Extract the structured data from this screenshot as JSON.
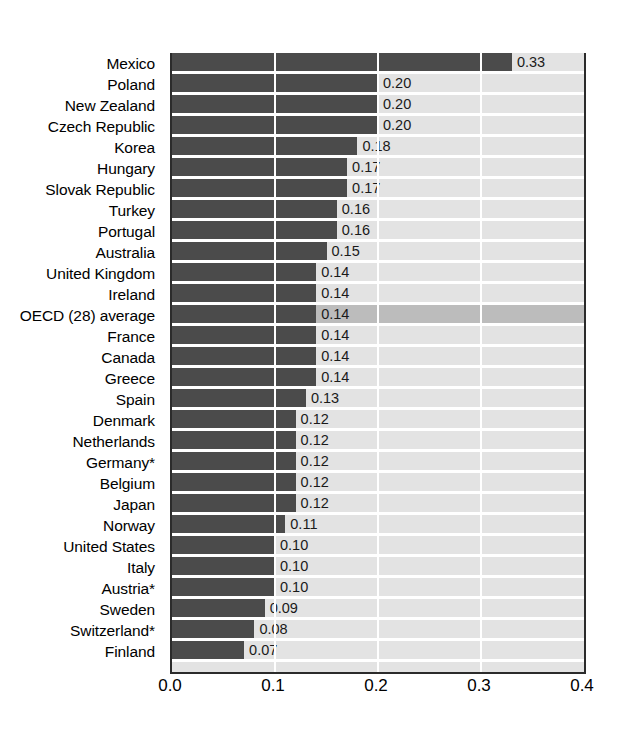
{
  "chart_data": {
    "type": "bar",
    "orientation": "horizontal",
    "title": "",
    "subtitle": "",
    "xlabel": "",
    "ylabel": "",
    "xlim": [
      0.0,
      0.4
    ],
    "xticks": [
      "0.0",
      "0.1",
      "0.2",
      "0.3",
      "0.4"
    ],
    "xtick_values": [
      0.0,
      0.1,
      0.2,
      0.3,
      0.4
    ],
    "grid": "vertical-white-gridlines",
    "legend": "none",
    "categories": [
      "Mexico",
      "Poland",
      "New Zealand",
      "Czech Republic",
      "Korea",
      "Hungary",
      "Slovak Republic",
      "Turkey",
      "Portugal",
      "Australia",
      "United Kingdom",
      "Ireland",
      "OECD (28) average",
      "France",
      "Canada",
      "Greece",
      "Spain",
      "Denmark",
      "Netherlands",
      "Germany*",
      "Belgium",
      "Japan",
      "Norway",
      "United States",
      "Italy",
      "Austria*",
      "Sweden",
      "Switzerland*",
      "Finland"
    ],
    "values": [
      0.33,
      0.2,
      0.2,
      0.2,
      0.18,
      0.17,
      0.17,
      0.16,
      0.16,
      0.15,
      0.14,
      0.14,
      0.14,
      0.14,
      0.14,
      0.14,
      0.13,
      0.12,
      0.12,
      0.12,
      0.12,
      0.12,
      0.11,
      0.1,
      0.1,
      0.1,
      0.09,
      0.08,
      0.07
    ],
    "value_labels": [
      "0.33",
      "0.20",
      "0.20",
      "0.20",
      "0.18",
      "0.17",
      "0.17",
      "0.16",
      "0.16",
      "0.15",
      "0.14",
      "0.14",
      "0.14",
      "0.14",
      "0.14",
      "0.14",
      "0.13",
      "0.12",
      "0.12",
      "0.12",
      "0.12",
      "0.12",
      "0.11",
      "0.10",
      "0.10",
      "0.10",
      "0.09",
      "0.08",
      "0.07"
    ],
    "highlighted_category": "OECD (28) average",
    "colors": {
      "bar": "#4b4b4b",
      "plot_background": "#e3e3e3",
      "row_separator": "#ffffff",
      "gridline": "#ffffff",
      "highlight_band": "#bcbcbc",
      "axis": "#2b2b2b",
      "text": "#000000"
    }
  }
}
